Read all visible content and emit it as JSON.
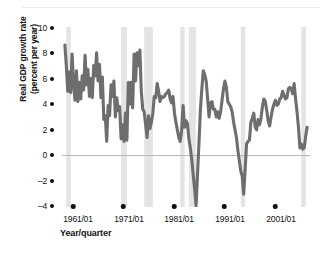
{
  "chart_data": {
    "type": "line",
    "title": "",
    "xlabel": "Year/quarter",
    "ylabel_line1": "Real GDP growth rate",
    "ylabel_line2": "(percent per year)",
    "ylim": [
      -4,
      10
    ],
    "yticks": [
      "10",
      "8",
      "6",
      "4",
      "2",
      "0",
      "-2",
      "-4"
    ],
    "ytick_values": [
      10,
      8,
      6,
      4,
      2,
      0,
      -2,
      -4
    ],
    "xticks": [
      "1961/01",
      "1971/01",
      "1981/01",
      "1991/01",
      "2001/01"
    ],
    "xtick_values": [
      1961,
      1971,
      1981,
      1991,
      2001
    ],
    "xlim": [
      1959.5,
      2002.5
    ],
    "grid": false,
    "legend": "none",
    "zero_line": true,
    "series": [
      {
        "name": "Real GDP growth rate",
        "color": "#6e6e6e",
        "x": [
          1960.0,
          1960.25,
          1960.5,
          1960.75,
          1961.0,
          1961.25,
          1961.5,
          1961.75,
          1962.0,
          1962.25,
          1962.5,
          1962.75,
          1963.0,
          1963.25,
          1963.5,
          1963.75,
          1964.0,
          1964.25,
          1964.5,
          1964.75,
          1965.0,
          1965.25,
          1965.5,
          1965.75,
          1966.0,
          1966.25,
          1966.5,
          1966.75,
          1967.0,
          1967.25,
          1967.5,
          1967.75,
          1968.0,
          1968.25,
          1968.5,
          1968.75,
          1969.0,
          1969.25,
          1969.5,
          1969.75,
          1970.0,
          1970.25,
          1970.5,
          1970.75,
          1971.0,
          1971.25,
          1971.5,
          1971.75,
          1972.0,
          1972.25,
          1972.5,
          1972.75,
          1973.0,
          1973.25,
          1973.5,
          1973.75,
          1974.0,
          1974.25,
          1974.5,
          1974.75,
          1975.0,
          1975.25,
          1975.5,
          1975.75,
          1976.0,
          1976.25,
          1976.5,
          1976.75,
          1977.0,
          1977.25,
          1977.5,
          1977.75,
          1978.0,
          1978.25,
          1978.5,
          1978.75,
          1979.0,
          1979.25,
          1979.5,
          1979.75,
          1980.0,
          1980.25,
          1980.5,
          1980.75,
          1981.0,
          1981.25,
          1981.5,
          1981.75,
          1982.0,
          1982.25,
          1982.5,
          1982.75,
          1983.0,
          1983.25,
          1983.5,
          1983.75,
          1984.0,
          1984.25,
          1984.5,
          1984.75,
          1985.0,
          1985.25,
          1985.5,
          1985.75,
          1986.0,
          1986.25,
          1986.5,
          1986.75,
          1987.0,
          1987.25,
          1987.5,
          1987.75,
          1988.0,
          1988.25,
          1988.5,
          1988.75,
          1989.0,
          1989.25,
          1989.5,
          1989.75,
          1990.0,
          1990.25,
          1990.5,
          1990.75,
          1991.0,
          1991.25,
          1991.5,
          1991.75,
          1992.0,
          1992.25,
          1992.5,
          1992.75,
          1993.0,
          1993.25,
          1993.5,
          1993.75,
          1994.0,
          1994.25,
          1994.5,
          1994.75,
          1995.0,
          1995.25,
          1995.5,
          1995.75,
          1996.0,
          1996.25,
          1996.5,
          1996.75,
          1997.0,
          1997.25,
          1997.5,
          1997.75,
          1998.0,
          1998.25,
          1998.5,
          1998.75,
          1999.0,
          1999.25,
          1999.5,
          1999.75,
          2000.0,
          2000.25,
          2000.5,
          2000.75,
          2001.0,
          2001.25,
          2001.5,
          2001.75,
          2002.0
        ],
        "y": [
          8.6,
          7.0,
          5.0,
          6.5,
          4.9,
          7.9,
          5.6,
          4.3,
          6.6,
          4.2,
          5.7,
          4.4,
          6.2,
          5.1,
          7.8,
          5.5,
          6.7,
          4.6,
          6.0,
          4.5,
          7.0,
          6.2,
          8.0,
          5.8,
          7.1,
          4.5,
          6.1,
          2.8,
          3.1,
          1.1,
          3.9,
          3.1,
          5.5,
          4.6,
          5.8,
          3.0,
          4.5,
          3.5,
          3.8,
          1.3,
          2.4,
          1.1,
          3.3,
          1.2,
          5.7,
          4.0,
          5.7,
          3.7,
          7.9,
          5.8,
          8.0,
          7.0,
          8.2,
          5.0,
          3.6,
          3.4,
          2.4,
          1.4,
          3.1,
          2.1,
          2.6,
          3.3,
          4.6,
          4.5,
          5.6,
          5.0,
          4.2,
          4.6,
          4.5,
          4.6,
          4.8,
          4.9,
          5.1,
          4.4,
          4.1,
          4.6,
          3.3,
          2.6,
          2.0,
          1.4,
          1.1,
          2.0,
          3.9,
          2.2,
          2.7,
          2.5,
          1.3,
          0.6,
          -0.3,
          -1.5,
          -2.6,
          -3.9,
          -1.4,
          1.0,
          3.6,
          5.2,
          6.6,
          6.3,
          5.8,
          4.4,
          3.0,
          4.1,
          4.2,
          3.6,
          3.6,
          3.0,
          3.4,
          2.9,
          3.4,
          4.3,
          5.2,
          5.8,
          5.3,
          4.2,
          4.0,
          3.8,
          3.4,
          2.6,
          2.0,
          1.4,
          0.4,
          -0.4,
          -1.2,
          -1.6,
          -3.0,
          -1.1,
          0.9,
          1.1,
          1.2,
          2.6,
          2.9,
          3.3,
          2.2,
          2.0,
          2.8,
          2.4,
          2.9,
          3.8,
          4.4,
          4.2,
          3.5,
          2.7,
          2.3,
          3.0,
          3.6,
          4.0,
          4.3,
          3.9,
          4.0,
          4.4,
          4.5,
          5.0,
          4.7,
          4.4,
          4.5,
          5.2,
          5.3,
          5.2,
          4.8,
          5.6,
          4.4,
          3.4,
          2.2,
          0.6,
          0.9,
          0.5,
          0.6,
          1.5,
          2.2
        ]
      }
    ],
    "recession_bands": [
      {
        "start": 1960.25,
        "end": 1961.0
      },
      {
        "start": 1969.75,
        "end": 1970.75
      },
      {
        "start": 1973.75,
        "end": 1975.25
      },
      {
        "start": 1980.0,
        "end": 1980.5
      },
      {
        "start": 1981.5,
        "end": 1982.75
      },
      {
        "start": 1990.5,
        "end": 1991.25
      },
      {
        "start": 2001.0,
        "end": 2001.75
      }
    ],
    "band_color": "#e4e4e4",
    "zero_line_color": "#b6b6b6"
  },
  "axes": {
    "y_ticks": [
      "10",
      "8",
      "6",
      "4",
      "2",
      "0",
      "–2",
      "–4"
    ],
    "x_ticks": [
      "1961/01",
      "1971/01",
      "1981/01",
      "1991/01",
      "2001/01"
    ],
    "y_title_line1": "Real GDP growth rate",
    "y_title_line2": "(percent per year)",
    "x_title": "Year/quarter"
  }
}
